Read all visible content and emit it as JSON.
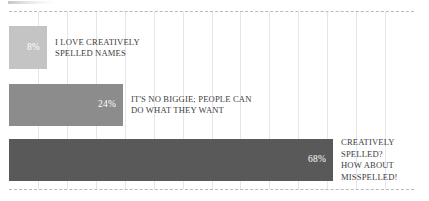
{
  "chart_data": {
    "type": "bar",
    "orientation": "horizontal",
    "title": "",
    "subtitle": "",
    "xlabel": "",
    "ylabel": "",
    "xlim": [
      0,
      100
    ],
    "grid": true,
    "gridlines_count": 14,
    "legend": "none",
    "value_suffix": "%",
    "categories": [
      "I LOVE CREATIVELY SPELLED NAMES",
      "IT'S NO BIGGIE; PEOPLE CAN DO WHAT THEY WANT",
      "CREATIVELY SPELLED? HOW ABOUT MISSPELLED!"
    ],
    "values": [
      8,
      24,
      68
    ],
    "bars": [
      {
        "value": 8,
        "value_label": "8%",
        "category_label": "I LOVE CREATIVELY\nSPELLED NAMES",
        "color": "#c4c4c4"
      },
      {
        "value": 24,
        "value_label": "24%",
        "category_label": "IT'S NO BIGGIE; PEOPLE CAN\nDO WHAT THEY WANT",
        "color": "#8c8c8c"
      },
      {
        "value": 68,
        "value_label": "68%",
        "category_label": "CREATIVELY\nSPELLED?\nHOW ABOUT\nMISSPELLED!",
        "color": "#595959"
      }
    ],
    "colors": {
      "bar_light": "#c4c4c4",
      "bar_mid": "#8c8c8c",
      "bar_dark": "#595959",
      "value_text": "#ffffff",
      "label_text": "#3d3d3d",
      "gridline": "#e6e6e6",
      "border_dashed": "#b9b9b9",
      "background": "#ffffff"
    }
  }
}
